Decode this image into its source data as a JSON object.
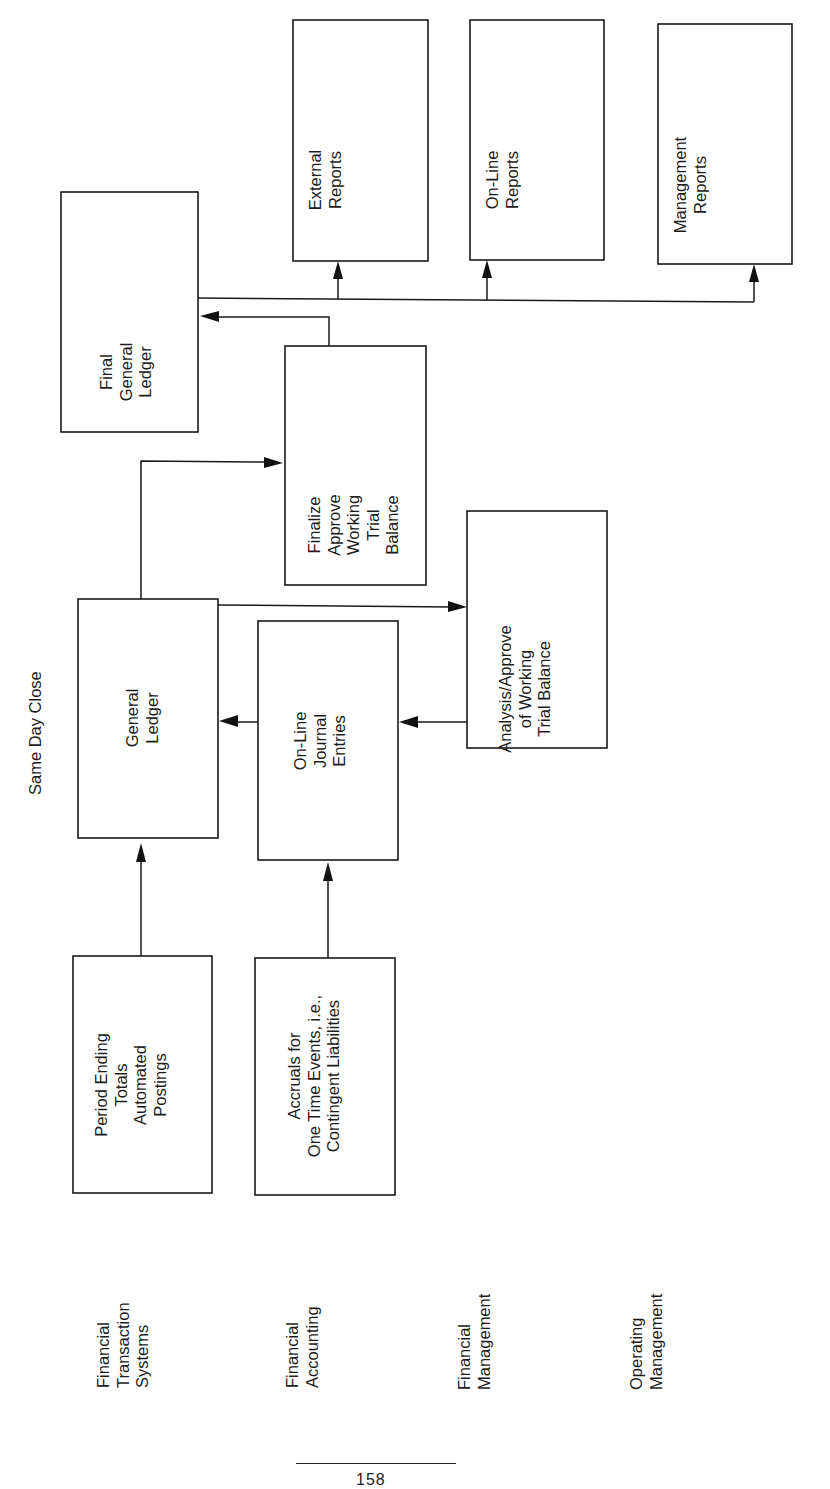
{
  "title": "Same Day Close",
  "rows": [
    {
      "label_lines": [
        "Financial",
        "Transaction",
        "Systems"
      ]
    },
    {
      "label_lines": [
        "Financial",
        "Accounting"
      ]
    },
    {
      "label_lines": [
        "Financial",
        "Management"
      ]
    },
    {
      "label_lines": [
        "Operating",
        "Management"
      ]
    }
  ],
  "boxes": {
    "period_ending": {
      "lines": [
        "Period Ending",
        "Totals",
        "Automated",
        "Postings"
      ]
    },
    "accruals": {
      "lines": [
        "Accruals for",
        "One Time Events, i.e.,",
        "Contingent Liabilities"
      ]
    },
    "general_ledger": {
      "lines": [
        "General",
        "Ledger"
      ]
    },
    "online_journal": {
      "lines": [
        "On-Line",
        "Journal",
        "Entries"
      ]
    },
    "analysis": {
      "lines": [
        "Analysis/Approve",
        "of Working",
        "Trial Balance"
      ]
    },
    "finalize": {
      "lines": [
        "Finalize",
        "Approve",
        "Working",
        "Trial",
        "Balance"
      ]
    },
    "final_gl": {
      "lines": [
        "Final",
        "General",
        "Ledger"
      ]
    },
    "external_reports": {
      "lines": [
        "External",
        "Reports"
      ]
    },
    "online_reports": {
      "lines": [
        "On-Line",
        "Reports"
      ]
    },
    "management_reports": {
      "lines": [
        "Management",
        "Reports"
      ]
    }
  },
  "flows": [
    {
      "from": "Period Ending Totals Automated Postings",
      "to": "General Ledger"
    },
    {
      "from": "Accruals for One Time Events",
      "to": "On-Line Journal Entries"
    },
    {
      "from": "On-Line Journal Entries",
      "to": "General Ledger"
    },
    {
      "from": "General Ledger",
      "to": "Analysis/Approve of Working Trial Balance"
    },
    {
      "from": "Analysis/Approve of Working Trial Balance",
      "to": "On-Line Journal Entries"
    },
    {
      "from": "General Ledger",
      "to": "Finalize Approve Working Trial Balance"
    },
    {
      "from": "Finalize Approve Working Trial Balance",
      "to": "Final General Ledger"
    },
    {
      "from": "Final General Ledger",
      "to": "External Reports"
    },
    {
      "from": "Final General Ledger",
      "to": "On-Line Reports"
    },
    {
      "from": "Final General Ledger",
      "to": "Management Reports"
    }
  ],
  "footer": {
    "page_number": "158"
  }
}
